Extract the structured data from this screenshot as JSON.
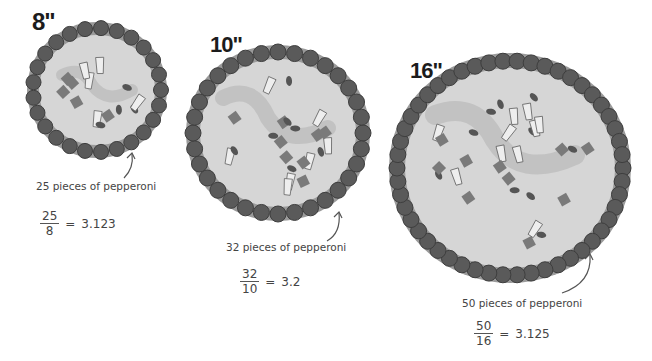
{
  "pizzas": [
    {
      "size_label": "8\"",
      "diameter_in": 8,
      "caption": "25 pieces of pepperoni",
      "pieces": 25,
      "formula": {
        "numerator": "25",
        "denominator": "8",
        "equals": "=",
        "result": "3.123"
      }
    },
    {
      "size_label": "10\"",
      "diameter_in": 10,
      "caption": "32 pieces of pepperoni",
      "pieces": 32,
      "formula": {
        "numerator": "32",
        "denominator": "10",
        "equals": "=",
        "result": "3.2"
      }
    },
    {
      "size_label": "16\"",
      "diameter_in": 16,
      "caption": "50 pieces of pepperoni",
      "pieces": 50,
      "formula": {
        "numerator": "50",
        "denominator": "16",
        "equals": "=",
        "result": "3.125"
      }
    }
  ],
  "colors": {
    "background": "#ffffff",
    "crust_edge": "#9a9a9a",
    "cheese": "#d6d6d6",
    "sauce_smear": "#bdbdbd",
    "pepperoni": "#5a5a5a",
    "pepperoni_edge": "#3e3e3e",
    "topping_dark": "#707070",
    "text": "#444444"
  }
}
